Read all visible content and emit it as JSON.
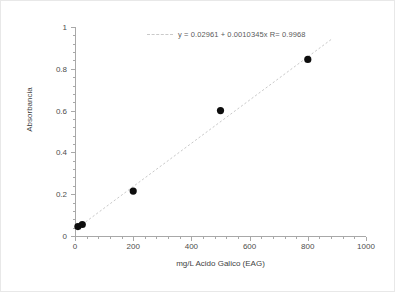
{
  "chart_data": {
    "type": "scatter",
    "title": "",
    "xlabel": "mg/L Acido Galico (EAG)",
    "ylabel": "Absorbancia",
    "xlim": [
      0,
      1000
    ],
    "ylim": [
      0,
      1
    ],
    "xticks": [
      0,
      200,
      400,
      600,
      800,
      1000
    ],
    "xtick_labels": [
      "0",
      "200",
      "400",
      "600",
      "800",
      "1000"
    ],
    "yticks": [
      0,
      0.2,
      0.4,
      0.6,
      0.8,
      1
    ],
    "ytick_labels": [
      "0",
      "0.2",
      "0.4",
      "0.6",
      "0.8",
      "1"
    ],
    "grid": false,
    "legend_position": "top-center",
    "series": [
      {
        "name": "data",
        "marker": "filled-circle",
        "color": "#0d0d0d",
        "x": [
          10,
          25,
          200,
          500,
          800
        ],
        "y": [
          0.045,
          0.055,
          0.215,
          0.6,
          0.845
        ]
      },
      {
        "name": "fit",
        "type": "line",
        "style": "dashed",
        "color": "#c9c9c9",
        "x": [
          0,
          880
        ],
        "y": [
          0.02961,
          0.93997
        ]
      }
    ],
    "annotations": [
      {
        "name": "fit-equation",
        "text": "y = 0.02961 + 0.0010345x   R= 0.9968",
        "slope": 0.0010345,
        "intercept": 0.02961,
        "r": 0.9968
      }
    ]
  },
  "legend": {
    "equation_text": "y = 0.02961 + 0.0010345x   R= 0.9968"
  },
  "colors": {
    "marker": "#0d0d0d",
    "fit_line": "#c9c9c9",
    "axis": "#a8a8a8",
    "text": "#4d4d4d",
    "background": "#ffffff"
  }
}
